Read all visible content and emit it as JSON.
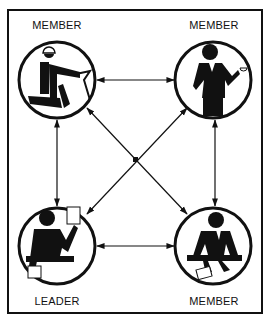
{
  "diagram": {
    "type": "communication-network",
    "nodes": [
      {
        "id": "tl",
        "label": "MEMBER",
        "icon": "seated-worker-with-hardhat"
      },
      {
        "id": "tr",
        "label": "MEMBER",
        "icon": "businessman-with-coffee-cup"
      },
      {
        "id": "bl",
        "label": "LEADER",
        "icon": "seated-leader-with-papers"
      },
      {
        "id": "br",
        "label": "MEMBER",
        "icon": "seated-person-with-document"
      }
    ],
    "edges": [
      {
        "from": "tl",
        "to": "tr",
        "style": "double-arrow"
      },
      {
        "from": "bl",
        "to": "br",
        "style": "double-arrow"
      },
      {
        "from": "tl",
        "to": "bl",
        "style": "double-arrow"
      },
      {
        "from": "tr",
        "to": "br",
        "style": "double-arrow"
      },
      {
        "from": "tl",
        "to": "br",
        "style": "double-arrow"
      },
      {
        "from": "tr",
        "to": "bl",
        "style": "double-arrow"
      }
    ],
    "colors": {
      "stroke": "#111111",
      "background": "#ffffff"
    }
  }
}
